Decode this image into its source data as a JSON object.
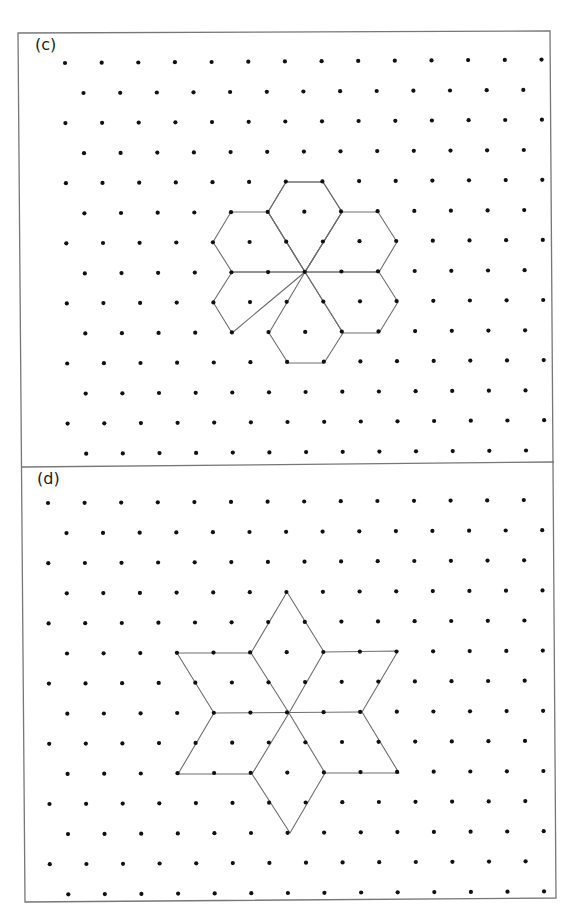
{
  "figure": {
    "frame": {
      "outline": [
        [
          18,
          33
        ],
        [
          550,
          31
        ],
        [
          556,
          898
        ],
        [
          25,
          902
        ]
      ],
      "divider": [
        [
          22,
          467
        ],
        [
          554,
          462
        ]
      ],
      "stroke": "#777777"
    },
    "panels": [
      {
        "id": "c",
        "label": "(c)",
        "shape_description": "six hexagons arranged as a flower around a central lattice point",
        "lattice": {
          "origin": [
            65,
            63
          ],
          "col_spacing": 36.65,
          "row_spacing": 30.05,
          "odd_row_offset": 18.3,
          "row_x_drift": 0.22,
          "col_y_drift": -0.26,
          "rows": 14,
          "even_row_count": 14,
          "odd_row_count": 13
        },
        "center_point": [
          305,
          272
        ],
        "shapes": [
          {
            "name": "hexagon-top",
            "points": [
              [
                286,
                182
              ],
              [
                323,
                182
              ],
              [
                342,
                212
              ],
              [
                305,
                272
              ],
              [
                268,
                212
              ]
            ]
          },
          {
            "name": "hexagon-top",
            "points": [
              [
                268,
                212
              ],
              [
                286,
                182
              ],
              [
                323,
                182
              ],
              [
                342,
                212
              ],
              [
                305,
                272
              ]
            ]
          },
          {
            "name": "hexagon-upper-left",
            "points": [
              [
                231,
                212
              ],
              [
                268,
                212
              ],
              [
                305,
                272
              ],
              [
                232,
                272
              ],
              [
                213,
                242
              ]
            ]
          },
          {
            "name": "hexagon-upper-right",
            "points": [
              [
                342,
                212
              ],
              [
                378,
                212
              ],
              [
                397,
                242
              ],
              [
                379,
                272
              ],
              [
                305,
                272
              ]
            ]
          },
          {
            "name": "hexagon-lower-left",
            "points": [
              [
                232,
                272
              ],
              [
                305,
                272
              ],
              [
                269,
                302
              ],
              [
                232,
                333
              ],
              [
                213,
                302
              ]
            ]
          },
          {
            "name": "hexagon-lower-right",
            "points": [
              [
                305,
                272
              ],
              [
                379,
                272
              ],
              [
                398,
                302
              ],
              [
                379,
                333
              ],
              [
                343,
                333
              ]
            ]
          },
          {
            "name": "hexagon-bottom",
            "points": [
              [
                305,
                272
              ],
              [
                343,
                333
              ],
              [
                324,
                363
              ],
              [
                288,
                363
              ],
              [
                269,
                333
              ]
            ]
          }
        ]
      },
      {
        "id": "d",
        "label": "(d)",
        "shape_description": "six-pointed star made of six rhombi around a central lattice point",
        "lattice": {
          "origin": [
            48,
            503
          ],
          "col_spacing": 36.6,
          "row_spacing": 30.1,
          "odd_row_offset": 18.3,
          "row_x_drift": 0.15,
          "col_y_drift": -0.22,
          "rows": 14,
          "even_row_count": 14,
          "odd_row_count": 14
        },
        "center_point": [
          289,
          713
        ],
        "shapes": [
          {
            "name": "star-outline",
            "points": [
              [
                287,
                592
              ],
              [
                324,
                652
              ],
              [
                398,
                651
              ],
              [
                362,
                712
              ],
              [
                399,
                773
              ],
              [
                325,
                773
              ],
              [
                290,
                833
              ],
              [
                252,
                774
              ],
              [
                178,
                774
              ],
              [
                214,
                713
              ],
              [
                177,
                653
              ],
              [
                251,
                653
              ]
            ]
          },
          {
            "name": "star-inner-lines",
            "segments": [
              [
                [
                  251,
                  653
                ],
                [
                  289,
                  713
                ]
              ],
              [
                [
                  324,
                  652
                ],
                [
                  289,
                  713
                ]
              ],
              [
                [
                  214,
                  713
                ],
                [
                  362,
                  712
                ]
              ],
              [
                [
                  252,
                  774
                ],
                [
                  289,
                  713
                ]
              ],
              [
                [
                  325,
                  773
                ],
                [
                  289,
                  713
                ]
              ]
            ]
          }
        ]
      }
    ],
    "colors": {
      "dot": "#111111",
      "line": "#6e6e6e",
      "background": "#ffffff"
    }
  }
}
